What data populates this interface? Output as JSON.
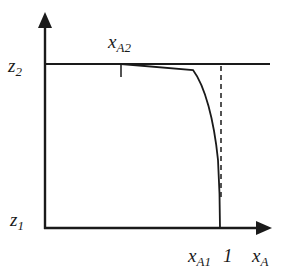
{
  "diagram": {
    "axes": {
      "y_label_top": "z",
      "y_label_top_sub": "2",
      "y_label_bottom": "z",
      "y_label_bottom_sub": "1",
      "x_axis_label": "x",
      "x_axis_label_sub": "A"
    },
    "annotations": {
      "xa2": "x",
      "xa2_sub": "A2",
      "xa1": "x",
      "xa1_sub": "A1",
      "one": "1"
    },
    "colors": {
      "stroke": "#1a1a1a",
      "background": "#ffffff"
    }
  }
}
